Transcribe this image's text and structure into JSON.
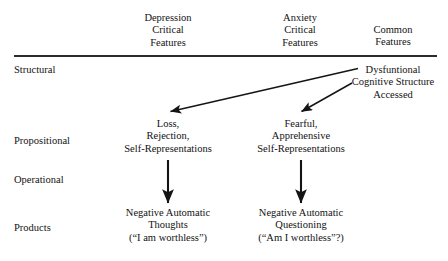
{
  "figure": {
    "columns": [
      {
        "id": "depression",
        "label": "Depression\nCritical\nFeatures",
        "center_x": 168
      },
      {
        "id": "anxiety",
        "label": "Anxiety\nCritical\nFeatures",
        "center_x": 300
      },
      {
        "id": "common",
        "label": "Common\nFeatures",
        "center_x": 393
      }
    ],
    "rows": [
      {
        "id": "structural",
        "label": "Structural"
      },
      {
        "id": "propositional",
        "label": "Propositional"
      },
      {
        "id": "operational",
        "label": "Operational"
      },
      {
        "id": "products",
        "label": "Products"
      }
    ],
    "cells": {
      "structural_common": "Dysfuntional\nCognitive Structure\nAccessed",
      "propositional_depression": "Loss,\nRejection,\nSelf-Representations",
      "propositional_anxiety": "Fearful,\nApprehensive\nSelf-Representations",
      "products_depression": "Negative Automatic\nThoughts\n(“I am worthless”)",
      "products_anxiety": "Negative Automatic\nQuestioning\n(“Am I worthless”?)"
    },
    "arrows": [
      {
        "id": "common-to-depression",
        "from": "structural_common",
        "to": "propositional_depression"
      },
      {
        "id": "common-to-anxiety",
        "from": "structural_common",
        "to": "propositional_anxiety"
      },
      {
        "id": "depression-prop-to-products",
        "from": "propositional_depression",
        "to": "products_depression"
      },
      {
        "id": "anxiety-prop-to-products",
        "from": "propositional_anxiety",
        "to": "products_anxiety"
      }
    ],
    "colors": {
      "text": "#121212",
      "rule": "#2b2b2b",
      "arrow": "#141414",
      "background": "#ffffff"
    }
  }
}
